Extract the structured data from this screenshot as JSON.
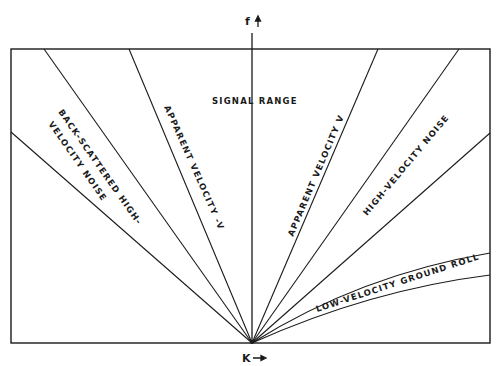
{
  "diagram": {
    "type": "f-k (frequency-wavenumber) domain diagram",
    "axes": {
      "vertical_label": "f",
      "horizontal_label": "K"
    },
    "regions": [
      {
        "id": "back-scattered",
        "label_line1": "BACK-SCATTERED HIGH-",
        "label_line2": "VELOCITY NOISE"
      },
      {
        "id": "apparent-velocity-neg",
        "label": "APPARENT VELOCITY -V"
      },
      {
        "id": "signal-range",
        "label": "SIGNAL RANGE"
      },
      {
        "id": "apparent-velocity-pos",
        "label": "APPARENT VELOCITY V"
      },
      {
        "id": "high-velocity-noise",
        "label": "HIGH-VELOCITY NOISE"
      },
      {
        "id": "ground-roll",
        "label": "LOW-VELOCITY GROUND ROLL"
      }
    ],
    "colors": {
      "line": "#1a1a1a",
      "background": "#ffffff"
    }
  }
}
